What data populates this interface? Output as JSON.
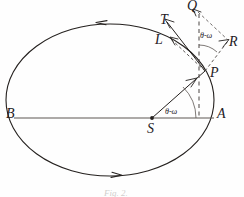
{
  "figure": {
    "background_color": "#fefefe",
    "ink_color": "#24201e",
    "caption": "Fig. 2."
  },
  "points": {
    "A": "A",
    "B": "B",
    "S": "S",
    "P": "P",
    "Q": "Q",
    "R": "R",
    "T": "T",
    "L": "L"
  },
  "angles": {
    "at_focus": "θ-ω",
    "at_point": "θ-ω"
  },
  "geometry": {
    "ellipse_center_x": 110,
    "ellipse_center_y": 100,
    "ellipse_rx": 104,
    "ellipse_ry": 76,
    "focus_x": 152,
    "focus_y": 118,
    "point_p_x": 205,
    "point_p_y": 71,
    "apoapsis_x": 214,
    "apoapsis_y": 118,
    "periapsis_x": 14,
    "periapsis_y": 118
  },
  "arrows": {
    "top_direction": "counterclockwise-arrowhead-left",
    "bottom_direction": "counterclockwise-arrowhead-right"
  }
}
